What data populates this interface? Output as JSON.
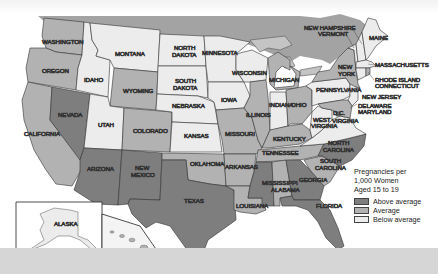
{
  "map": {
    "title": "Pregnancies per 1,000 Women Aged 15 to 19",
    "colors": {
      "above": "#7e7e7e",
      "average": "#b2b2b2",
      "below": "#ececec",
      "water": "#9a9a9a",
      "canada": "#a8a8a8"
    },
    "states": {
      "washington": {
        "label": "WASHINGTON",
        "category": "average"
      },
      "oregon": {
        "label": "OREGON",
        "category": "average"
      },
      "california": {
        "label": "CALIFORNIA",
        "category": "average"
      },
      "nevada": {
        "label": "NEVADA",
        "category": "above"
      },
      "idaho": {
        "label": "IDAHO",
        "category": "below"
      },
      "montana": {
        "label": "MONTANA",
        "category": "below"
      },
      "wyoming": {
        "label": "WYOMING",
        "category": "average"
      },
      "utah": {
        "label": "UTAH",
        "category": "below"
      },
      "colorado": {
        "label": "COLORADO",
        "category": "average"
      },
      "arizona": {
        "label": "ARIZONA",
        "category": "above"
      },
      "new_mexico": {
        "label": "NEW MEXICO",
        "category": "above"
      },
      "north_dakota": {
        "label": "NORTH DAKOTA",
        "category": "below"
      },
      "south_dakota": {
        "label": "SOUTH DAKOTA",
        "category": "below"
      },
      "nebraska": {
        "label": "NEBRASKA",
        "category": "below"
      },
      "kansas": {
        "label": "KANSAS",
        "category": "below"
      },
      "oklahoma": {
        "label": "OKLAHOMA",
        "category": "average"
      },
      "texas": {
        "label": "TEXAS",
        "category": "above"
      },
      "minnesota": {
        "label": "MINNESOTA",
        "category": "below"
      },
      "iowa": {
        "label": "IOWA",
        "category": "below"
      },
      "missouri": {
        "label": "MISSOURI",
        "category": "average"
      },
      "arkansas": {
        "label": "ARKANSAS",
        "category": "average"
      },
      "louisiana": {
        "label": "LOUISIANA",
        "category": "average"
      },
      "wisconsin": {
        "label": "WISCONSIN",
        "category": "below"
      },
      "illinois": {
        "label": "ILLINOIS",
        "category": "average"
      },
      "michigan": {
        "label": "MICHIGAN",
        "category": "average"
      },
      "indiana": {
        "label": "INDIANA",
        "category": "below"
      },
      "ohio": {
        "label": "OHIO",
        "category": "average"
      },
      "kentucky": {
        "label": "KENTUCKY",
        "category": "average"
      },
      "tennessee": {
        "label": "TENNESSEE",
        "category": "average"
      },
      "mississippi": {
        "label": "MISSISSIPPI",
        "category": "above"
      },
      "alabama": {
        "label": "ALABAMA",
        "category": "average"
      },
      "georgia": {
        "label": "GEORGIA",
        "category": "above"
      },
      "florida": {
        "label": "FLORIDA",
        "category": "above"
      },
      "south_carolina": {
        "label": "SOUTH CAROLINA",
        "category": "average"
      },
      "north_carolina": {
        "label": "NORTH CAROLINA",
        "category": "above"
      },
      "virginia": {
        "label": "VIRGINIA",
        "category": "below"
      },
      "west_virginia": {
        "label": "WEST VIRGINIA",
        "category": "below"
      },
      "pennsylvania": {
        "label": "PENNSYLVANIA",
        "category": "below"
      },
      "new_york": {
        "label": "NEW YORK",
        "category": "average"
      },
      "new_jersey": {
        "label": "NEW JERSEY",
        "category": "below"
      },
      "delaware": {
        "label": "DELAWARE",
        "category": "average"
      },
      "maryland": {
        "label": "MARYLAND",
        "category": "average"
      },
      "dc": {
        "label": "D.C.",
        "category": "above"
      },
      "vermont": {
        "label": "VERMONT",
        "category": "below"
      },
      "new_hampshire": {
        "label": "NEW HAMPSHIRE",
        "category": "below"
      },
      "maine": {
        "label": "MAINE",
        "category": "below"
      },
      "massachusetts": {
        "label": "MASSACHUSETTS",
        "category": "below"
      },
      "rhode_island": {
        "label": "RHODE ISLAND",
        "category": "average"
      },
      "connecticut": {
        "label": "CONNECTICUT",
        "category": "below"
      },
      "alaska": {
        "label": "ALASKA",
        "category": "below"
      },
      "hawaii": {
        "label": "HAWAII",
        "category": "average"
      }
    }
  },
  "legend": {
    "title_line1": "Pregnancies per",
    "title_line2": "1,000 Women",
    "title_line3": "Aged 15 to 19",
    "items": [
      {
        "label": "Above average",
        "color": "#7e7e7e"
      },
      {
        "label": "Average",
        "color": "#b2b2b2"
      },
      {
        "label": "Below average",
        "color": "#ececec"
      }
    ]
  }
}
